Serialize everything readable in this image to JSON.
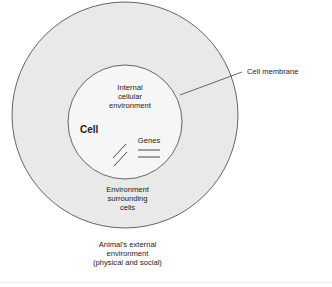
{
  "diagram": {
    "labels": {
      "internal": [
        "Internal",
        "cellular",
        "environment"
      ],
      "cell": "Cell",
      "genes": "Genes",
      "surrounding": [
        "Environment",
        "surrounding",
        "cells"
      ],
      "external": [
        "Animal's external",
        "environment",
        "(physical and social)"
      ],
      "membrane": "Cell membrane"
    },
    "colors": {
      "outer_fill": "#e8e8e8",
      "inner_fill": "#f5f5f5",
      "stroke": "#555555"
    }
  }
}
